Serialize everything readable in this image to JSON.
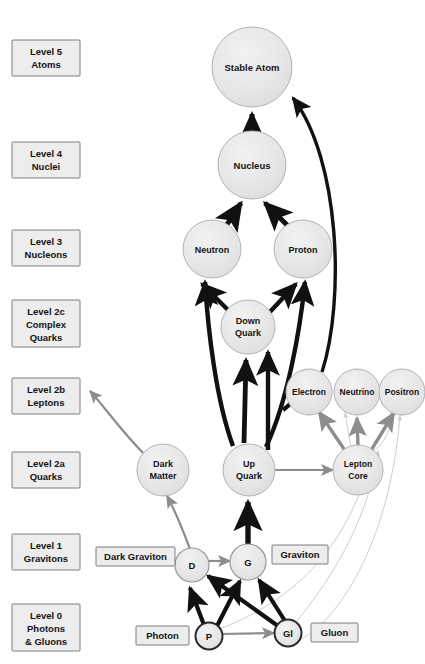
{
  "figure": {
    "title": "Figure 6 — The Levolution of Particles"
  },
  "levels": [
    {
      "id": "level-5",
      "line1": "Level  5",
      "line2": "Atoms",
      "line3": ""
    },
    {
      "id": "level-4",
      "line1": "Level  4",
      "line2": "Nuclei",
      "line3": ""
    },
    {
      "id": "level-3",
      "line1": "Level  3",
      "line2": "Nucleons",
      "line3": ""
    },
    {
      "id": "level-2c",
      "line1": "Level 2c",
      "line2": "Complex",
      "line3": "Quarks"
    },
    {
      "id": "level-2b",
      "line1": "Level 2b",
      "line2": "Leptons",
      "line3": ""
    },
    {
      "id": "level-2a",
      "line1": "Level 2a",
      "line2": "Quarks",
      "line3": ""
    },
    {
      "id": "level-1",
      "line1": "Level  1",
      "line2": "Gravitons",
      "line3": ""
    },
    {
      "id": "level-0",
      "line1": "Level  0",
      "line2": "Photons",
      "line3": "& Gluons"
    }
  ],
  "nodes": {
    "stable_atom": {
      "label": "Stable Atom"
    },
    "nucleus": {
      "label": "Nucleus"
    },
    "neutron": {
      "label": "Neutron"
    },
    "proton": {
      "label": "Proton"
    },
    "down_quark": {
      "line1": "Down",
      "line2": "Quark"
    },
    "electron": {
      "label": "Electron"
    },
    "neutrino": {
      "label": "Neutrino"
    },
    "positron": {
      "label": "Positron"
    },
    "dark_matter": {
      "line1": "Dark",
      "line2": "Matter"
    },
    "up_quark": {
      "line1": "Up",
      "line2": "Quark"
    },
    "lepton_core": {
      "line1": "Lepton",
      "line2": "Core"
    },
    "dark_graviton": {
      "label": "D"
    },
    "graviton": {
      "label": "G"
    },
    "photon": {
      "label": "P"
    },
    "gluon": {
      "label": "Gl"
    }
  },
  "tags": {
    "dark_graviton": "Dark Graviton",
    "graviton": "Graviton",
    "photon": "Photon",
    "gluon": "Gluon"
  },
  "colors": {
    "node_fill": "#e8e8e8",
    "node_stroke": "#9a9a9a",
    "box_fill": "#ededed",
    "box_stroke": "#7d7d7d",
    "arrow_dark": "#111111",
    "arrow_gray": "#8d8d8d",
    "arrow_faint": "#cfcfcf",
    "text": "#141414",
    "background": "#ffffff"
  }
}
